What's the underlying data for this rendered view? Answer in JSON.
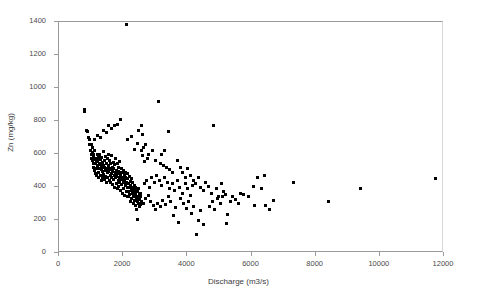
{
  "chart_data": {
    "type": "scatter",
    "title": "",
    "xlabel": "Discharge (m3/s)",
    "ylabel": "Zn (mg/kg)",
    "xlim": [
      0,
      12000
    ],
    "ylim": [
      0,
      1400
    ],
    "xticks": [
      0,
      2000,
      4000,
      6000,
      8000,
      10000,
      12000
    ],
    "yticks": [
      0,
      200,
      400,
      600,
      800,
      1000,
      1200,
      1400
    ],
    "xtick_labels": [
      "0",
      "2000",
      "4000",
      "6000",
      "8000",
      "10000",
      "12000"
    ],
    "ytick_labels": [
      "0",
      "200",
      "400",
      "600",
      "800",
      "1000",
      "1200",
      "1400"
    ],
    "grid": false,
    "legend": null,
    "marker": "square",
    "marker_color": "#000000",
    "marker_size_px": 3,
    "series": [
      {
        "name": "Zn vs Discharge",
        "points": [
          [
            780,
            870
          ],
          [
            800,
            860
          ],
          [
            860,
            745
          ],
          [
            900,
            735
          ],
          [
            920,
            700
          ],
          [
            950,
            655
          ],
          [
            960,
            690
          ],
          [
            980,
            620
          ],
          [
            1000,
            660
          ],
          [
            1010,
            600
          ],
          [
            1020,
            575
          ],
          [
            1030,
            640
          ],
          [
            1040,
            560
          ],
          [
            1050,
            610
          ],
          [
            1060,
            545
          ],
          [
            1070,
            585
          ],
          [
            1080,
            520
          ],
          [
            1090,
            600
          ],
          [
            1100,
            565
          ],
          [
            1110,
            500
          ],
          [
            1120,
            620
          ],
          [
            1130,
            540
          ],
          [
            1140,
            480
          ],
          [
            1150,
            575
          ],
          [
            1160,
            555
          ],
          [
            1170,
            515
          ],
          [
            1180,
            470
          ],
          [
            1190,
            600
          ],
          [
            1200,
            530
          ],
          [
            1210,
            560
          ],
          [
            1220,
            490
          ],
          [
            1230,
            580
          ],
          [
            1240,
            455
          ],
          [
            1250,
            545
          ],
          [
            1260,
            510
          ],
          [
            1270,
            595
          ],
          [
            1280,
            470
          ],
          [
            1290,
            535
          ],
          [
            1300,
            565
          ],
          [
            1310,
            440
          ],
          [
            1320,
            505
          ],
          [
            1330,
            580
          ],
          [
            1340,
            525
          ],
          [
            1350,
            460
          ],
          [
            1360,
            550
          ],
          [
            1370,
            495
          ],
          [
            1380,
            615
          ],
          [
            1390,
            530
          ],
          [
            1400,
            475
          ],
          [
            1410,
            560
          ],
          [
            1420,
            445
          ],
          [
            1430,
            520
          ],
          [
            1440,
            585
          ],
          [
            1450,
            500
          ],
          [
            1460,
            465
          ],
          [
            1470,
            545
          ],
          [
            1480,
            425
          ],
          [
            1490,
            510
          ],
          [
            1500,
            570
          ],
          [
            1510,
            485
          ],
          [
            1520,
            455
          ],
          [
            1530,
            530
          ],
          [
            1540,
            600
          ],
          [
            1550,
            495
          ],
          [
            1560,
            440
          ],
          [
            1570,
            515
          ],
          [
            1580,
            560
          ],
          [
            1590,
            470
          ],
          [
            1600,
            505
          ],
          [
            1610,
            430
          ],
          [
            1620,
            545
          ],
          [
            1630,
            480
          ],
          [
            1640,
            590
          ],
          [
            1650,
            460
          ],
          [
            1660,
            520
          ],
          [
            1670,
            415
          ],
          [
            1680,
            495
          ],
          [
            1690,
            550
          ],
          [
            1700,
            445
          ],
          [
            1710,
            510
          ],
          [
            1720,
            470
          ],
          [
            1730,
            400
          ],
          [
            1740,
            535
          ],
          [
            1750,
            485
          ],
          [
            1760,
            575
          ],
          [
            1770,
            455
          ],
          [
            1780,
            420
          ],
          [
            1790,
            500
          ],
          [
            1800,
            465
          ],
          [
            1810,
            540
          ],
          [
            1820,
            390
          ],
          [
            1830,
            480
          ],
          [
            1840,
            520
          ],
          [
            1850,
            440
          ],
          [
            1860,
            495
          ],
          [
            1870,
            405
          ],
          [
            1880,
            460
          ],
          [
            1890,
            555
          ],
          [
            1900,
            430
          ],
          [
            1910,
            490
          ],
          [
            1920,
            380
          ],
          [
            1930,
            470
          ],
          [
            1940,
            510
          ],
          [
            1950,
            445
          ],
          [
            1960,
            415
          ],
          [
            1970,
            485
          ],
          [
            1980,
            360
          ],
          [
            1990,
            455
          ],
          [
            2000,
            500
          ],
          [
            2010,
            425
          ],
          [
            2020,
            390
          ],
          [
            2030,
            470
          ],
          [
            2040,
            440
          ],
          [
            2050,
            350
          ],
          [
            2060,
            490
          ],
          [
            2070,
            410
          ],
          [
            2080,
            460
          ],
          [
            2090,
            375
          ],
          [
            2100,
            1385
          ],
          [
            2110,
            430
          ],
          [
            2120,
            480
          ],
          [
            2130,
            345
          ],
          [
            2140,
            400
          ],
          [
            2150,
            450
          ],
          [
            2160,
            370
          ],
          [
            2170,
            420
          ],
          [
            2180,
            340
          ],
          [
            2190,
            465
          ],
          [
            2200,
            395
          ],
          [
            2210,
            355
          ],
          [
            2220,
            435
          ],
          [
            2230,
            310
          ],
          [
            2240,
            410
          ],
          [
            2250,
            380
          ],
          [
            2260,
            450
          ],
          [
            2270,
            330
          ],
          [
            2280,
            395
          ],
          [
            2290,
            360
          ],
          [
            2300,
            425
          ],
          [
            2310,
            300
          ],
          [
            2320,
            385
          ],
          [
            2330,
            340
          ],
          [
            2340,
            410
          ],
          [
            2350,
            320
          ],
          [
            2360,
            370
          ],
          [
            2370,
            290
          ],
          [
            2380,
            400
          ],
          [
            2390,
            355
          ],
          [
            2400,
            330
          ],
          [
            2410,
            380
          ],
          [
            2420,
            265
          ],
          [
            2430,
            345
          ],
          [
            2440,
            310
          ],
          [
            2450,
            370
          ],
          [
            2460,
            205
          ],
          [
            2470,
            335
          ],
          [
            2480,
            390
          ],
          [
            2490,
            300
          ],
          [
            2500,
            355
          ],
          [
            2510,
            325
          ],
          [
            2520,
            280
          ],
          [
            2530,
            360
          ],
          [
            2540,
            340
          ],
          [
            2550,
            295
          ],
          [
            2560,
            315
          ],
          [
            1930,
            810
          ],
          [
            1830,
            780
          ],
          [
            1720,
            775
          ],
          [
            1640,
            755
          ],
          [
            1550,
            770
          ],
          [
            1470,
            730
          ],
          [
            1380,
            745
          ],
          [
            1290,
            700
          ],
          [
            1200,
            715
          ],
          [
            1120,
            690
          ],
          [
            2560,
            775
          ],
          [
            2480,
            745
          ],
          [
            2600,
            720
          ],
          [
            2250,
            705
          ],
          [
            2150,
            690
          ],
          [
            2700,
            660
          ],
          [
            2620,
            640
          ],
          [
            2560,
            620
          ],
          [
            2440,
            665
          ],
          [
            2350,
            630
          ],
          [
            2800,
            600
          ],
          [
            2900,
            620
          ],
          [
            2750,
            575
          ],
          [
            2680,
            555
          ],
          [
            2600,
            590
          ],
          [
            3000,
            560
          ],
          [
            3100,
            920
          ],
          [
            3150,
            545
          ],
          [
            3250,
            530
          ],
          [
            3400,
            735
          ],
          [
            3300,
            620
          ],
          [
            3200,
            600
          ],
          [
            3350,
            520
          ],
          [
            3450,
            505
          ],
          [
            3550,
            490
          ],
          [
            2620,
            300
          ],
          [
            2700,
            330
          ],
          [
            2780,
            350
          ],
          [
            2860,
            310
          ],
          [
            2940,
            290
          ],
          [
            2650,
            420
          ],
          [
            2730,
            440
          ],
          [
            2810,
            400
          ],
          [
            2890,
            455
          ],
          [
            2970,
            425
          ],
          [
            3050,
            470
          ],
          [
            3130,
            440
          ],
          [
            3210,
            410
          ],
          [
            3290,
            455
          ],
          [
            3370,
            425
          ],
          [
            3450,
            390
          ],
          [
            3530,
            420
          ],
          [
            3610,
            380
          ],
          [
            3690,
            440
          ],
          [
            3770,
            400
          ],
          [
            3850,
            360
          ],
          [
            3930,
            420
          ],
          [
            4010,
            390
          ],
          [
            4090,
            350
          ],
          [
            4170,
            410
          ],
          [
            3000,
            265
          ],
          [
            3080,
            300
          ],
          [
            3160,
            280
          ],
          [
            3240,
            320
          ],
          [
            3320,
            295
          ],
          [
            3400,
            340
          ],
          [
            3480,
            310
          ],
          [
            3560,
            230
          ],
          [
            3640,
            275
          ],
          [
            3720,
            185
          ],
          [
            3800,
            330
          ],
          [
            3880,
            300
          ],
          [
            3960,
            270
          ],
          [
            4040,
            310
          ],
          [
            4120,
            240
          ],
          [
            4200,
            280
          ],
          [
            4280,
            110
          ],
          [
            4350,
            195
          ],
          [
            4420,
            260
          ],
          [
            4500,
            175
          ],
          [
            3700,
            560
          ],
          [
            3780,
            520
          ],
          [
            3860,
            490
          ],
          [
            3940,
            455
          ],
          [
            4020,
            510
          ],
          [
            4100,
            470
          ],
          [
            4180,
            440
          ],
          [
            4260,
            420
          ],
          [
            4340,
            455
          ],
          [
            4420,
            400
          ],
          [
            4500,
            380
          ],
          [
            4580,
            430
          ],
          [
            4660,
            405
          ],
          [
            4740,
            360
          ],
          [
            4820,
            775
          ],
          [
            4900,
            390
          ],
          [
            4980,
            345
          ],
          [
            5060,
            420
          ],
          [
            5140,
            370
          ],
          [
            5220,
            180
          ],
          [
            4700,
            280
          ],
          [
            4780,
            310
          ],
          [
            4860,
            265
          ],
          [
            4940,
            330
          ],
          [
            5020,
            300
          ],
          [
            5100,
            340
          ],
          [
            5180,
            355
          ],
          [
            5260,
            235
          ],
          [
            5340,
            310
          ],
          [
            5420,
            345
          ],
          [
            5500,
            325
          ],
          [
            5580,
            300
          ],
          [
            5660,
            360
          ],
          [
            5750,
            355
          ],
          [
            5900,
            345
          ],
          [
            6050,
            405
          ],
          [
            6100,
            285
          ],
          [
            6200,
            460
          ],
          [
            6300,
            390
          ],
          [
            6400,
            470
          ],
          [
            6450,
            285
          ],
          [
            6550,
            265
          ],
          [
            6700,
            320
          ],
          [
            7300,
            430
          ],
          [
            8400,
            315
          ],
          [
            9400,
            390
          ],
          [
            11750,
            450
          ]
        ]
      }
    ]
  },
  "axes": {
    "x_title": "Discharge (m3/s)",
    "y_title": "Zn (mg/kg)"
  }
}
